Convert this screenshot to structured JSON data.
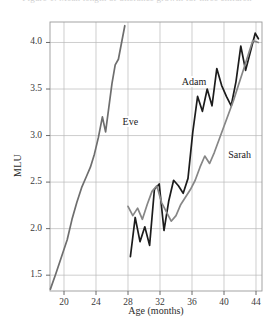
{
  "figure": {
    "caption_fragment": "Figure 1. Mean length of utterance growth for three children",
    "background_color": "#ffffff"
  },
  "chart_data": {
    "type": "line",
    "title": "",
    "subtitle": "",
    "xlabel": "Age (months)",
    "ylabel": "MLU",
    "xlim": [
      18.25,
      44.75
    ],
    "ylim": [
      1.33,
      4.22
    ],
    "xticks": [
      20,
      24,
      28,
      32,
      36,
      40,
      44
    ],
    "xtick_labels": [
      "20",
      "24",
      "28",
      "32",
      "36",
      "40",
      "44"
    ],
    "yticks": [
      1.5,
      2.0,
      2.5,
      3.0,
      3.5,
      4.0
    ],
    "ytick_labels": [
      "1.5",
      "2.0",
      "2.5",
      "3.0",
      "3.5",
      "4.0"
    ],
    "grid": true,
    "grid_color": "#b9b9b9",
    "legend": "inline-labels",
    "series": [
      {
        "name": "Eve",
        "color": "#6e6e6e",
        "label_x": 27.2,
        "label_y": 3.13,
        "x": [
          18.3,
          19.0,
          19.7,
          20.4,
          21.0,
          21.6,
          22.2,
          22.8,
          23.3,
          23.8,
          24.3,
          24.8,
          25.2,
          25.6,
          26.0,
          26.4,
          26.8,
          27.2,
          27.6
        ],
        "y": [
          1.35,
          1.52,
          1.7,
          1.88,
          2.1,
          2.28,
          2.44,
          2.56,
          2.66,
          2.8,
          2.98,
          3.2,
          3.04,
          3.3,
          3.56,
          3.76,
          3.82,
          4.0,
          4.18
        ]
      },
      {
        "name": "Adam",
        "color": "#1c1c1c",
        "label_x": 34.6,
        "label_y": 3.56,
        "x": [
          28.3,
          28.9,
          29.5,
          30.1,
          30.7,
          31.3,
          31.9,
          32.5,
          33.1,
          33.7,
          34.3,
          34.9,
          35.5,
          36.1,
          36.7,
          37.3,
          37.9,
          38.5,
          39.1,
          39.7,
          40.3,
          40.9,
          41.5,
          42.1,
          42.7,
          43.3,
          43.9,
          44.3
        ],
        "y": [
          1.7,
          2.12,
          1.86,
          2.02,
          1.82,
          2.42,
          2.48,
          1.98,
          2.3,
          2.52,
          2.46,
          2.38,
          2.54,
          3.04,
          3.42,
          3.26,
          3.5,
          3.32,
          3.72,
          3.54,
          3.42,
          3.32,
          3.58,
          3.96,
          3.7,
          3.9,
          4.1,
          4.04
        ]
      },
      {
        "name": "Sarah",
        "color": "#868686",
        "label_x": 40.4,
        "label_y": 2.78,
        "x": [
          28.0,
          28.6,
          29.2,
          29.8,
          30.4,
          31.0,
          31.6,
          32.2,
          32.8,
          33.4,
          34.0,
          34.6,
          35.2,
          35.8,
          36.4,
          37.0,
          37.6,
          38.2,
          38.8,
          39.4,
          40.0,
          40.6,
          41.2,
          41.8,
          42.4,
          43.0,
          43.6,
          44.3
        ],
        "y": [
          2.24,
          2.14,
          2.22,
          2.1,
          2.26,
          2.4,
          2.46,
          2.28,
          2.18,
          2.08,
          2.14,
          2.26,
          2.34,
          2.42,
          2.52,
          2.66,
          2.78,
          2.7,
          2.82,
          2.96,
          3.1,
          3.24,
          3.38,
          3.54,
          3.7,
          3.86,
          4.02,
          4.0
        ]
      }
    ]
  }
}
